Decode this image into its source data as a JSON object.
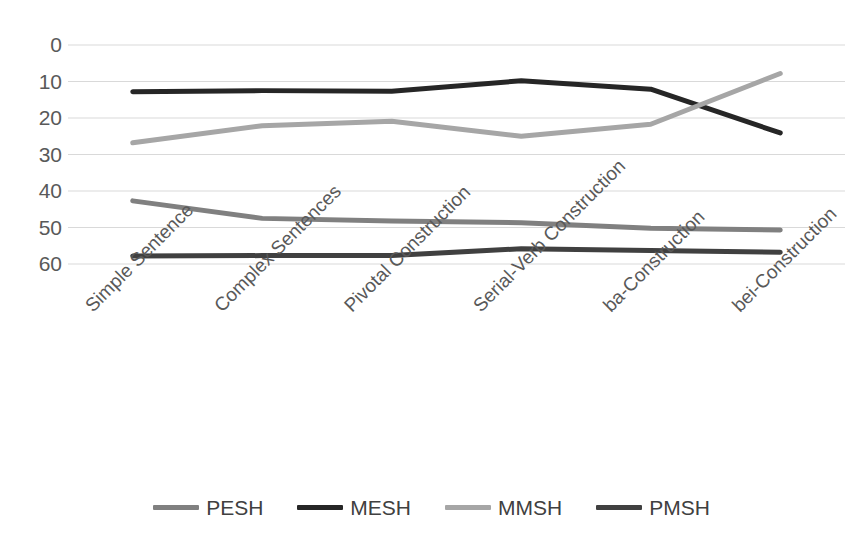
{
  "chart_data": {
    "type": "line",
    "title": "",
    "xlabel": "",
    "ylabel": "",
    "ylim": [
      0,
      60
    ],
    "yticks": [
      0,
      10,
      20,
      30,
      40,
      50,
      60
    ],
    "grid": true,
    "legend_position": "bottom",
    "categories": [
      "Simple Sentence",
      "Complex Sentences",
      "Pivotal Construction",
      "Serial-Verb Construction",
      "ba-Construction",
      "bei-Construction"
    ],
    "series": [
      {
        "name": "PESH",
        "color": "#808080",
        "values": [
          17.3,
          12.5,
          11.8,
          11.3,
          9.8,
          9.3
        ]
      },
      {
        "name": "MESH",
        "color": "#262626",
        "values": [
          47.2,
          47.5,
          47.3,
          50.2,
          47.9,
          35.9
        ]
      },
      {
        "name": "MMSH",
        "color": "#a6a6a6",
        "values": [
          33.2,
          37.9,
          39.1,
          35.0,
          38.3,
          52.2
        ]
      },
      {
        "name": "PMSH",
        "color": "#404040",
        "values": [
          2.2,
          2.3,
          2.3,
          4.2,
          3.7,
          3.2
        ]
      }
    ]
  },
  "axes": {
    "ytick_labels": [
      "60",
      "50",
      "40",
      "30",
      "20",
      "10",
      "0"
    ],
    "xtick_labels": [
      "Simple Sentence",
      "Complex Sentences",
      "Pivotal Construction",
      "Serial-Verb Construction",
      "ba-Construction",
      "bei-Construction"
    ]
  },
  "legend": {
    "items": [
      {
        "label": "PESH",
        "color": "#808080"
      },
      {
        "label": "MESH",
        "color": "#262626"
      },
      {
        "label": "MMSH",
        "color": "#a6a6a6"
      },
      {
        "label": "PMSH",
        "color": "#404040"
      }
    ]
  },
  "style": {
    "gridline_color": "#d9d9d9",
    "tick_text_color": "#595959",
    "background": "#ffffff"
  }
}
